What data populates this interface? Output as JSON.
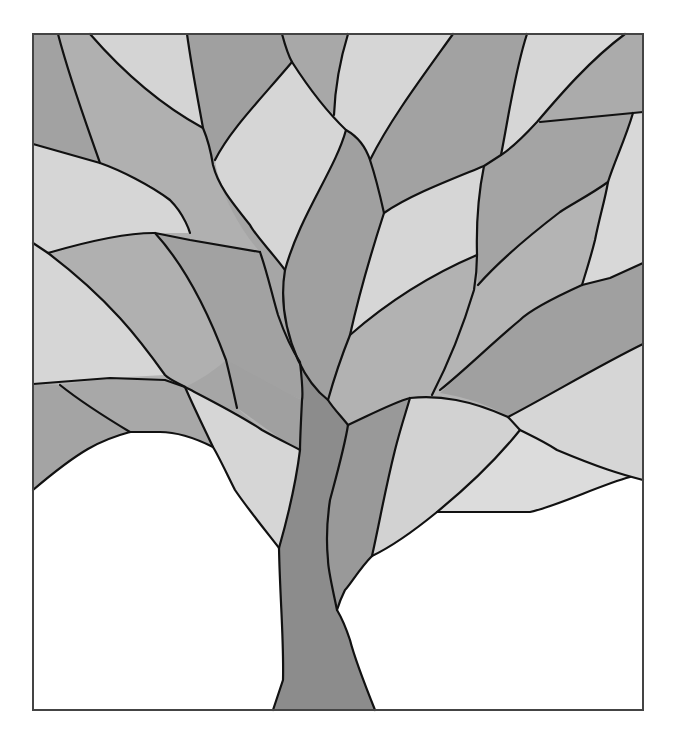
{
  "artwork": {
    "title": "Stained glass tree pattern",
    "description": "Grayscale leaded-glass style tree with leaf-shaped panes and a split trunk on a white ground",
    "frame": {
      "x": 33,
      "y": 34,
      "width": 610,
      "height": 676
    },
    "palette": {
      "trunk": "#8c8c8c",
      "dark": "#a2a2a2",
      "mid": "#b3b3b3",
      "light": "#d0d0d0",
      "lightest": "#dedede",
      "ground": "#ffffff",
      "lead": "#111111"
    }
  }
}
